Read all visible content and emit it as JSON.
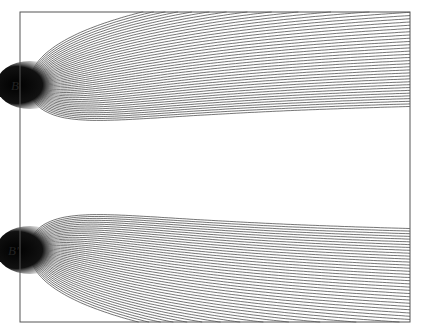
{
  "figure": {
    "frame": {
      "x": 20,
      "y": 12,
      "width": 390,
      "height": 310
    },
    "sources": [
      {
        "id": "B",
        "label": "B",
        "x": 30,
        "y": 85,
        "label_x": 11,
        "label_y": 90
      },
      {
        "id": "B-prime",
        "label": "B′",
        "x": 30,
        "y": 250,
        "label_x": 8,
        "label_y": 255
      }
    ],
    "lines_per_source": 44,
    "line_color": "#3a3a3a",
    "frame_color": "#555555"
  }
}
